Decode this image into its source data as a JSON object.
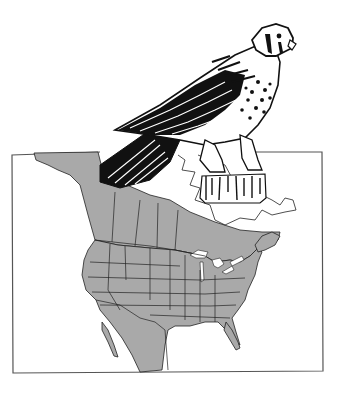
{
  "illustration": {
    "subject": "kestrel-perched-on-post-over-range-map",
    "colors": {
      "background": "#ffffff",
      "ink": "#111111",
      "range_fill": "#a9a9a9",
      "frame": "#555555",
      "lakes": "#ffffff"
    },
    "map": {
      "region": "North America",
      "frame": {
        "x": 10,
        "y": 152,
        "width": 314,
        "height": 220
      }
    }
  }
}
